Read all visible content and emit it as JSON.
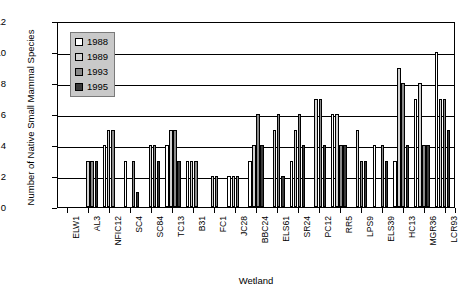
{
  "chart_data": {
    "type": "bar",
    "title": "",
    "xlabel": "Wetland",
    "ylabel": "Number of Native Small Mammal Species",
    "ylim": [
      0,
      12
    ],
    "yticks": [
      0,
      2,
      4,
      6,
      8,
      10,
      12
    ],
    "grid": true,
    "legend_position": "inside-top-left",
    "categories": [
      "ELW1",
      "AL3",
      "NFIC12",
      "SC4",
      "SC84",
      "TC13",
      "B31",
      "FC1",
      "JC28",
      "BBC24",
      "ELS61",
      "SR24",
      "PC12",
      "RR5",
      "LPS9",
      "ELS39",
      "HC13",
      "MGR36",
      "LCR93"
    ],
    "series": [
      {
        "name": "1988",
        "color": "#ffffff",
        "values": [
          0,
          0,
          4,
          3,
          0,
          4,
          3,
          0,
          2,
          3,
          0,
          3,
          0,
          6,
          0,
          4,
          3,
          7,
          10
        ]
      },
      {
        "name": "1989",
        "color": "#d2d2d2",
        "values": [
          0,
          3,
          5,
          0,
          4,
          5,
          3,
          2,
          2,
          4,
          5,
          5,
          7,
          6,
          5,
          0,
          9,
          8,
          7
        ]
      },
      {
        "name": "1993",
        "color": "#8a8a8a",
        "values": [
          0,
          3,
          5,
          3,
          4,
          5,
          3,
          2,
          2,
          6,
          6,
          6,
          7,
          4,
          3,
          4,
          8,
          4,
          7
        ]
      },
      {
        "name": "1995",
        "color": "#3a3a3a",
        "values": [
          0,
          3,
          0,
          1,
          3,
          3,
          0,
          0,
          0,
          4,
          2,
          4,
          4,
          4,
          3,
          3,
          4,
          4,
          5
        ]
      }
    ]
  },
  "legend": {
    "entries": [
      {
        "label": "1988"
      },
      {
        "label": "1989"
      },
      {
        "label": "1993"
      },
      {
        "label": "1995"
      }
    ]
  }
}
